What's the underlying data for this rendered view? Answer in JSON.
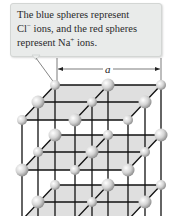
{
  "callout": {
    "line1": "The blue spheres represent",
    "line2_pre": "Cl",
    "line2_sup": "−",
    "line2_post": " ions, and the red spheres",
    "line3_pre": "represent Na",
    "line3_sup": "+",
    "line3_post": " ions."
  },
  "dimension": {
    "label": "a"
  },
  "colors": {
    "callout_bg": "#e9ebea",
    "plane_fill": "#d9d9d9",
    "line": "#111111",
    "sphere": "#d0d0d0"
  }
}
